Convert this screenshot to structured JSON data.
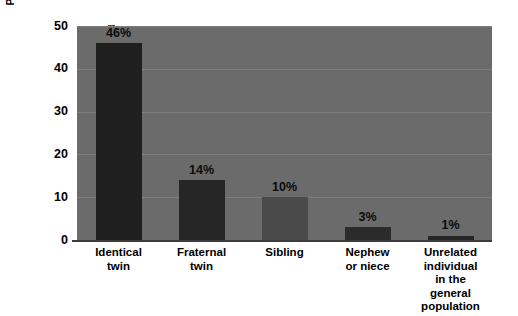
{
  "chart_data": {
    "type": "bar",
    "title": "",
    "subtitle": "",
    "xlabel": "",
    "ylabel": "Percentage of risk",
    "categories": [
      "Identical\ntwin",
      "Fraternal\ntwin",
      "Sibling",
      "Nephew\nor niece",
      "Unrelated\nindividual\nin the\ngeneral\npopulation"
    ],
    "values": [
      46,
      14,
      10,
      3,
      1
    ],
    "data_labels": [
      "46%",
      "14%",
      "10%",
      "3%",
      "1%"
    ],
    "ylim": [
      0,
      50
    ],
    "yticks": [
      0,
      10,
      20,
      30,
      40,
      50
    ],
    "ytick_labels": [
      "0",
      "10",
      "20",
      "30",
      "40",
      "50"
    ],
    "grid": true,
    "grid_axis": "y",
    "legend": false,
    "legend_position": "none",
    "bar_colors": [
      "#1f1f1f",
      "#262626",
      "#4a4a4a",
      "#2b2b2b",
      "#262626"
    ],
    "plot_background": "#6b6b6b",
    "page_background": "#ffffff",
    "gridline_color": "#7e7e7e",
    "axis_color": "#3c3c3c",
    "text_color": "#000000"
  },
  "axes": {
    "y_title": "Percentage of risk"
  }
}
